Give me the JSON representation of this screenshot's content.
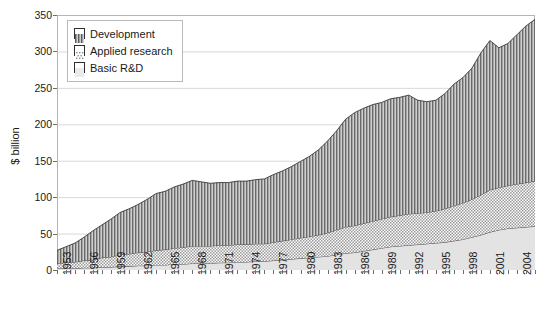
{
  "chart_data": {
    "type": "area",
    "stacked": true,
    "title": "",
    "subtitle": "",
    "xlabel": "",
    "ylabel": "$ billion",
    "ylim": [
      0,
      350
    ],
    "ytick_step": 50,
    "yticks": [
      0,
      50,
      100,
      150,
      200,
      250,
      300,
      350
    ],
    "grid": true,
    "grid_axis": "y",
    "legend_position": "top-left",
    "xtick_interval": 3,
    "xtick_labels": [
      "1953",
      "1956",
      "1959",
      "1962",
      "1965",
      "1968",
      "1971",
      "1974",
      "1977",
      "1980",
      "1983",
      "1986",
      "1989",
      "1992",
      "1995",
      "1998",
      "2001",
      "2004"
    ],
    "x": [
      1953,
      1954,
      1955,
      1956,
      1957,
      1958,
      1959,
      1960,
      1961,
      1962,
      1963,
      1964,
      1965,
      1966,
      1967,
      1968,
      1969,
      1970,
      1971,
      1972,
      1973,
      1974,
      1975,
      1976,
      1977,
      1978,
      1979,
      1980,
      1981,
      1982,
      1983,
      1984,
      1985,
      1986,
      1987,
      1988,
      1989,
      1990,
      1991,
      1992,
      1993,
      1994,
      1995,
      1996,
      1997,
      1998,
      1999,
      2000,
      2001,
      2002,
      2003,
      2004,
      2005,
      2006
    ],
    "series": [
      {
        "name": "Basic R&D",
        "pattern": "solid-light-gray",
        "color": "#e0e0e0",
        "values": [
          2,
          2,
          2,
          3,
          3,
          4,
          4,
          5,
          5,
          6,
          6,
          7,
          7,
          8,
          8,
          9,
          9,
          9,
          10,
          10,
          11,
          11,
          12,
          12,
          13,
          14,
          15,
          16,
          17,
          18,
          19,
          21,
          23,
          24,
          26,
          28,
          30,
          32,
          33,
          34,
          35,
          36,
          37,
          38,
          40,
          42,
          45,
          48,
          52,
          55,
          57,
          58,
          59,
          60
        ]
      },
      {
        "name": "Applied research",
        "pattern": "dotted",
        "color": "#f2f2f2",
        "values": [
          7,
          8,
          9,
          10,
          11,
          13,
          14,
          16,
          17,
          18,
          19,
          20,
          21,
          22,
          23,
          24,
          24,
          24,
          24,
          24,
          24,
          24,
          24,
          24,
          25,
          26,
          27,
          28,
          29,
          30,
          32,
          34,
          36,
          37,
          38,
          39,
          40,
          41,
          42,
          43,
          43,
          43,
          44,
          46,
          48,
          50,
          52,
          55,
          58,
          58,
          59,
          60,
          61,
          62
        ]
      },
      {
        "name": "Development",
        "pattern": "vertical-stripes",
        "color": "#a8a8a8",
        "values": [
          18,
          22,
          26,
          32,
          40,
          45,
          52,
          58,
          62,
          66,
          72,
          78,
          80,
          84,
          87,
          90,
          88,
          86,
          86,
          86,
          87,
          87,
          88,
          89,
          93,
          96,
          100,
          105,
          110,
          117,
          126,
          136,
          148,
          155,
          158,
          160,
          160,
          162,
          162,
          163,
          155,
          152,
          152,
          158,
          167,
          172,
          180,
          195,
          205,
          192,
          195,
          205,
          215,
          222
        ]
      }
    ],
    "totals": [
      27,
      32,
      37,
      45,
      54,
      62,
      70,
      79,
      84,
      90,
      97,
      105,
      108,
      114,
      118,
      123,
      121,
      119,
      120,
      120,
      122,
      122,
      124,
      125,
      131,
      136,
      142,
      149,
      156,
      165,
      177,
      191,
      207,
      216,
      222,
      227,
      230,
      235,
      237,
      240,
      233,
      231,
      233,
      242,
      255,
      264,
      277,
      298,
      315,
      305,
      311,
      323,
      335,
      344
    ],
    "legend": [
      {
        "label": "Development",
        "pattern": "vertical-stripes"
      },
      {
        "label": "Applied research",
        "pattern": "dotted"
      },
      {
        "label": "Basic R&D",
        "pattern": "solid-light-gray"
      }
    ]
  }
}
